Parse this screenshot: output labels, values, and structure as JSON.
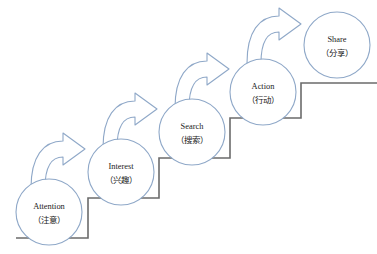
{
  "diagram": {
    "type": "staircase-flow",
    "colors": {
      "background": "#ffffff",
      "circle_stroke": "#8fa8c8",
      "arrow_stroke": "#8fa8c8",
      "stair_stroke": "#6b6b6b",
      "text": "#1a1a1a"
    },
    "stages": [
      {
        "id": "attention",
        "label_en": "Attention",
        "label_zh": "（注意）",
        "cx": 49,
        "cy": 212,
        "r": 33
      },
      {
        "id": "interest",
        "label_en": "Interest",
        "label_zh": "（兴趣）",
        "cx": 121,
        "cy": 172,
        "r": 33
      },
      {
        "id": "search",
        "label_en": "Search",
        "label_zh": "（搜索）",
        "cx": 192,
        "cy": 132,
        "r": 33
      },
      {
        "id": "action",
        "label_en": "Action",
        "label_zh": "（行动）",
        "cx": 263,
        "cy": 92,
        "r": 33
      },
      {
        "id": "share",
        "label_en": "Share",
        "label_zh": "（分享）",
        "cx": 337,
        "cy": 45,
        "r": 33
      }
    ],
    "arrows": [
      {
        "id": "attention-to-interest",
        "tx": 31,
        "ty": 139
      },
      {
        "id": "interest-to-search",
        "tx": 103,
        "ty": 99
      },
      {
        "id": "search-to-action",
        "tx": 175,
        "ty": 59
      },
      {
        "id": "action-to-share",
        "tx": 247,
        "ty": 14
      }
    ],
    "staircase": {
      "points": "16,238 88,238 88,198 159,198 159,158 230,158 230,118 301,118 301,83 377,83"
    }
  }
}
